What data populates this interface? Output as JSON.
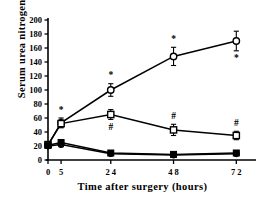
{
  "chart_data": {
    "type": "line",
    "title": "",
    "xlabel": "Time after surgery (hours)",
    "ylabel": "Serum urea nitrogen (mg/dl)",
    "x": [
      0,
      5,
      24,
      48,
      72
    ],
    "xticklabels": [
      "0",
      "5",
      "2 4",
      "4 8",
      "7 2"
    ],
    "xlim": [
      0,
      78
    ],
    "ylim": [
      0,
      200
    ],
    "yticks": [
      0,
      20,
      40,
      60,
      80,
      100,
      120,
      140,
      160,
      180,
      200
    ],
    "yticklabels": [
      "0",
      "20",
      "40",
      "60",
      "80",
      "100",
      "120",
      "140",
      "160",
      "180",
      "200"
    ],
    "grid": false,
    "legend": "none",
    "series": [
      {
        "name": "open-circle",
        "marker": "open-circle",
        "values": [
          21,
          53,
          100,
          148,
          170
        ],
        "errors": [
          3,
          7,
          9,
          13,
          14
        ],
        "annotations": [
          "",
          "*",
          "*",
          "*",
          "*"
        ],
        "annotation_side": [
          "",
          "above",
          "above",
          "above",
          "below"
        ]
      },
      {
        "name": "open-square",
        "marker": "open-square",
        "values": [
          22,
          52,
          65,
          43,
          35
        ],
        "errors": [
          3,
          5,
          7,
          8,
          6
        ],
        "annotations": [
          "",
          "",
          "#",
          "#",
          "#"
        ],
        "annotation_side": [
          "",
          "",
          "below",
          "above",
          "above"
        ]
      },
      {
        "name": "filled-square",
        "marker": "filled-square",
        "values": [
          21,
          25,
          10,
          8,
          10
        ],
        "errors": [
          2,
          3,
          2,
          2,
          3
        ],
        "annotations": [
          "",
          "",
          "",
          "",
          ""
        ],
        "annotation_side": [
          "",
          "",
          "",
          "",
          ""
        ]
      },
      {
        "name": "filled-circle",
        "marker": "filled-circle",
        "values": [
          20,
          22,
          9,
          7,
          9
        ],
        "errors": [
          2,
          3,
          2,
          2,
          2
        ],
        "annotations": [
          "",
          "",
          "",
          "",
          ""
        ],
        "annotation_side": [
          "",
          "",
          "",
          "",
          ""
        ]
      }
    ]
  },
  "axes": {
    "ylabel_text": "Serum urea nitrogen  (mg/dl)",
    "xlabel_text": "Time after surgery  (hours)"
  }
}
